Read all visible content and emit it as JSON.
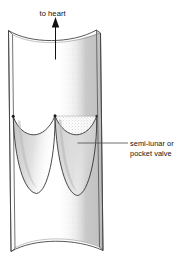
{
  "figure": {
    "background_color": "#ffffff",
    "line_color": "#1a1a1a",
    "shade_color": "#c9c9c9",
    "stipple_color": "#d8d8d8"
  },
  "annotations": {
    "flow_label": "to heart",
    "flow_direction": "up",
    "valve_label_line1": "semi-lunar or",
    "valve_label_line2": "pocket valve"
  },
  "parts": {
    "vessel_name": "vein-wall",
    "lumen_name": "vessel-lumen",
    "cusp_left_name": "valve-cusp-left",
    "cusp_right_name": "valve-cusp-right",
    "arrow_name": "blood-flow-arrow",
    "leader_name": "valve-leader-line"
  }
}
